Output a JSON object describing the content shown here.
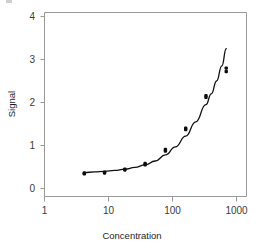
{
  "chart_data": {
    "type": "scatter",
    "title": "",
    "subtitle": "",
    "xlabel": "Concentration",
    "ylabel": "Signal",
    "xscale": "log",
    "yscale": "linear",
    "xlim": [
      1,
      1000
    ],
    "ylim": [
      0,
      4.2
    ],
    "xticks": [
      1,
      10,
      100,
      1000
    ],
    "xtick_labels": [
      "1",
      "10",
      "100",
      "1000"
    ],
    "yticks": [
      0,
      1,
      2,
      3,
      4
    ],
    "ytick_labels": [
      "0",
      "1",
      "2",
      "3",
      "4"
    ],
    "grid": false,
    "legend": false,
    "legend_position": "none",
    "series": [
      {
        "name": "Observed replicates",
        "marker": "filled-square-pair",
        "color": "#0d0d0d",
        "points": [
          {
            "x": 3.9,
            "y": 0.36
          },
          {
            "x": 3.9,
            "y": 0.34
          },
          {
            "x": 7.8,
            "y": 0.38
          },
          {
            "x": 7.8,
            "y": 0.36
          },
          {
            "x": 15.6,
            "y": 0.45
          },
          {
            "x": 15.6,
            "y": 0.43
          },
          {
            "x": 31.2,
            "y": 0.58
          },
          {
            "x": 31.2,
            "y": 0.55
          },
          {
            "x": 62.5,
            "y": 0.91
          },
          {
            "x": 62.5,
            "y": 0.87
          },
          {
            "x": 125,
            "y": 1.4
          },
          {
            "x": 125,
            "y": 1.37
          },
          {
            "x": 250,
            "y": 2.16
          },
          {
            "x": 250,
            "y": 2.12
          },
          {
            "x": 500,
            "y": 2.8
          },
          {
            "x": 500,
            "y": 2.72
          }
        ]
      },
      {
        "name": "Fitted calibration curve",
        "marker": "none",
        "color": "#111111",
        "curve": [
          {
            "x": 3.9,
            "y": 0.37
          },
          {
            "x": 5.5,
            "y": 0.385
          },
          {
            "x": 7.8,
            "y": 0.4
          },
          {
            "x": 11.0,
            "y": 0.42
          },
          {
            "x": 15.6,
            "y": 0.45
          },
          {
            "x": 22.0,
            "y": 0.49
          },
          {
            "x": 31.2,
            "y": 0.55
          },
          {
            "x": 44.0,
            "y": 0.64
          },
          {
            "x": 62.5,
            "y": 0.78
          },
          {
            "x": 88.0,
            "y": 0.97
          },
          {
            "x": 125,
            "y": 1.22
          },
          {
            "x": 176,
            "y": 1.55
          },
          {
            "x": 250,
            "y": 1.95
          },
          {
            "x": 300,
            "y": 2.2
          },
          {
            "x": 360,
            "y": 2.5
          },
          {
            "x": 430,
            "y": 2.85
          },
          {
            "x": 500,
            "y": 3.25
          }
        ]
      }
    ]
  },
  "axes": {
    "y_title": "Signal",
    "x_title": "Concentration"
  }
}
